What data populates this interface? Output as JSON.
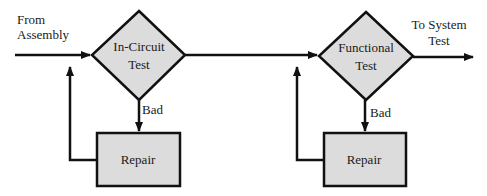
{
  "diagram": {
    "type": "flowchart",
    "colors": {
      "stroke": "#111111",
      "node_fill": "#dcdcdc",
      "background": "#ffffff",
      "text": "#1a1a1a"
    },
    "labels": {
      "input": [
        "From",
        "Assembly"
      ],
      "output": [
        "To System",
        "Test"
      ]
    },
    "nodes": [
      {
        "id": "in_circuit_test",
        "shape": "diamond",
        "lines": [
          "In-Circuit",
          "Test"
        ]
      },
      {
        "id": "repair_1",
        "shape": "rectangle",
        "label": "Repair"
      },
      {
        "id": "functional_test",
        "shape": "diamond",
        "lines": [
          "Functional",
          "Test"
        ]
      },
      {
        "id": "repair_2",
        "shape": "rectangle",
        "label": "Repair"
      }
    ],
    "edges": [
      {
        "from": "input",
        "to": "in_circuit_test",
        "label": ""
      },
      {
        "from": "in_circuit_test",
        "to": "repair_1",
        "label": "Bad"
      },
      {
        "from": "repair_1",
        "to": "in_circuit_test",
        "label": ""
      },
      {
        "from": "in_circuit_test",
        "to": "functional_test",
        "label": ""
      },
      {
        "from": "functional_test",
        "to": "repair_2",
        "label": "Bad"
      },
      {
        "from": "repair_2",
        "to": "functional_test",
        "label": ""
      },
      {
        "from": "functional_test",
        "to": "output",
        "label": ""
      }
    ],
    "edge_labels": {
      "bad_1": "Bad",
      "bad_2": "Bad"
    }
  }
}
